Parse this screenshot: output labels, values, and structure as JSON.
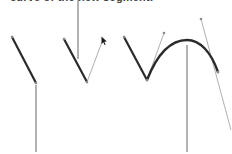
{
  "caption": "curve of the new segment.",
  "colors": {
    "segment": "#2b2b2b",
    "handle": "#9a9a9a",
    "pointer_line": "#555555",
    "anchor": "#8a8a8a",
    "background": "#ffffff"
  },
  "figures": [
    {
      "name": "straight-segment",
      "description": "Straight segment with leader line"
    },
    {
      "name": "drag-direction-line",
      "description": "Segment with direction line being dragged"
    },
    {
      "name": "curved-segment",
      "description": "Resulting curved segment with handles"
    }
  ]
}
